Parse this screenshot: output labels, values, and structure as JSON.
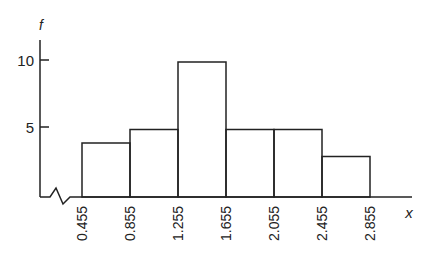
{
  "chart_data": {
    "type": "bar",
    "subtype": "histogram",
    "title": "",
    "xlabel": "x",
    "ylabel": "f",
    "bin_edges": [
      "0.455",
      "0.855",
      "1.255",
      "1.655",
      "2.055",
      "2.455",
      "2.855"
    ],
    "categories": [
      "0.455-0.855",
      "0.855-1.255",
      "1.255-1.655",
      "1.655-2.055",
      "2.055-2.455",
      "2.455-2.855"
    ],
    "values": [
      4,
      5,
      10,
      5,
      5,
      3
    ],
    "y_ticks": [
      "5",
      "10"
    ],
    "ylim": [
      0,
      11
    ],
    "grid": false,
    "legend": null,
    "axis_break": "x-axis broken near origin (zigzag)"
  },
  "colors": {
    "line": "#222222",
    "background": "#ffffff"
  }
}
